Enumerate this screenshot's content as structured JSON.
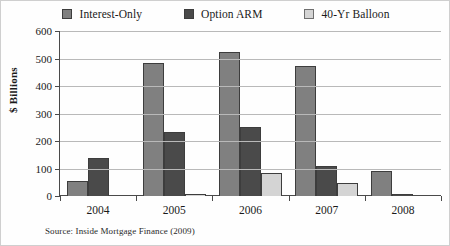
{
  "chart_data": {
    "type": "bar",
    "title": "",
    "subtitle": "",
    "xlabel": "",
    "ylabel": "$ Billions",
    "ylim": [
      0,
      600
    ],
    "ytick_step": 100,
    "yticks": [
      0,
      100,
      200,
      300,
      400,
      500,
      600
    ],
    "grid": true,
    "legend_position": "top-center",
    "categories": [
      "2004",
      "2005",
      "2006",
      "2007",
      "2008"
    ],
    "series": [
      {
        "name": "Interest-Only",
        "color": "#808080",
        "values": [
          55,
          485,
          523,
          473,
          90
        ]
      },
      {
        "name": "Option ARM",
        "color": "#4a4a4a",
        "values": [
          140,
          233,
          250,
          108,
          8
        ]
      },
      {
        "name": "40-Yr Balloon",
        "color": "#d4d4d4",
        "values": [
          0,
          8,
          85,
          48,
          0
        ]
      }
    ],
    "annotations": [
      "Source: Inside Mortgage Finance (2009)"
    ]
  },
  "legend": {
    "items": [
      {
        "label": "Interest-Only",
        "swatch_color": "#808080"
      },
      {
        "label": "Option ARM",
        "swatch_color": "#4a4a4a"
      },
      {
        "label": "40-Yr Balloon",
        "swatch_color": "#d4d4d4"
      }
    ]
  },
  "axes": {
    "y_title": "$ Billions",
    "y_tick_labels": [
      "600",
      "500",
      "400",
      "300",
      "200",
      "100",
      "0"
    ],
    "x_tick_labels": [
      "2004",
      "2005",
      "2006",
      "2007",
      "2008"
    ]
  },
  "footnote": {
    "source": "Source: Inside Mortgage Finance (2009)"
  },
  "colors": {
    "interest_only": "#808080",
    "option_arm": "#4a4a4a",
    "balloon": "#d4d4d4",
    "gridline": "#b9b9b9",
    "axis": "#4a4a4a",
    "background": "#ffffff"
  }
}
